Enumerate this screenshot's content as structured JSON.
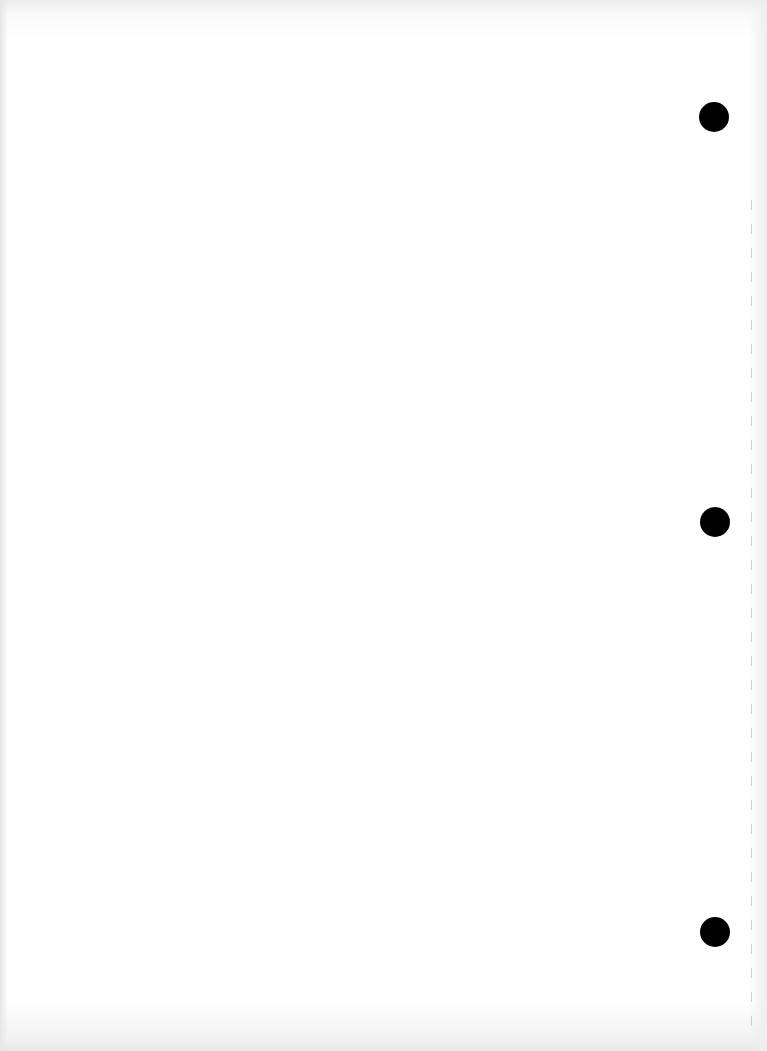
{
  "document": {
    "type": "scanned blank page",
    "content_text": "",
    "punch_holes": [
      {
        "cx": 714,
        "cy": 117,
        "r": 15
      },
      {
        "cx": 715,
        "cy": 522,
        "r": 15
      },
      {
        "cx": 715,
        "cy": 932,
        "r": 15
      }
    ],
    "colors": {
      "paper": "#ffffff",
      "hole": "#000000",
      "edge_shadow": "#e6e6e6",
      "tick_mark": "#cfcfcf"
    },
    "edge_tick_marks": {
      "x": 751,
      "start_y": 200,
      "spacing": 24,
      "count": 35
    }
  }
}
